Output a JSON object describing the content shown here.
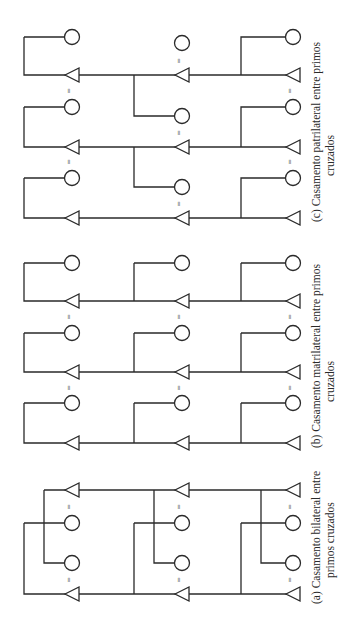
{
  "figure": {
    "orientation": "rotated-90-ccw",
    "line_color": "#2a2a2a",
    "background": "#ffffff",
    "legend": {
      "triangle": "male",
      "circle": "female",
      "equals": "marriage"
    },
    "panels": [
      {
        "id": "a",
        "caption_line1": "(a) Casamento bilateral entre",
        "caption_line2": "primos cruzados",
        "marriage_symbol": "="
      },
      {
        "id": "b",
        "caption_line1": "(b)  Casamento  matrilateral  entre  primos",
        "caption_line2": "cruzados",
        "marriage_symbol": "="
      },
      {
        "id": "c",
        "caption_line1": "(c)  Casamento  patrilateral  entre  primos",
        "caption_line2": "cruzados",
        "marriage_symbol": "="
      }
    ]
  }
}
